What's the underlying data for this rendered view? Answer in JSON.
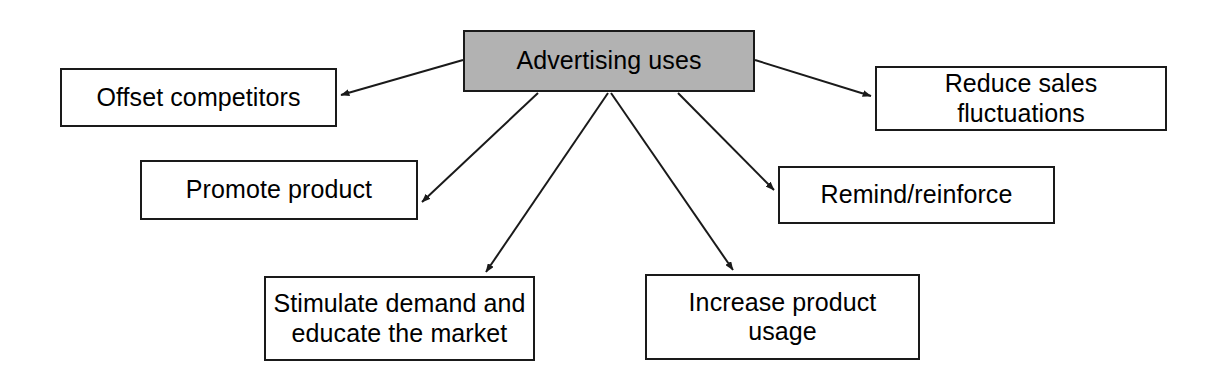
{
  "diagram": {
    "title": "Advertising uses",
    "type": "radial-concept-map",
    "background_color": "#ffffff",
    "root": {
      "id": "root",
      "label": "Advertising uses",
      "fill_color": "#b2b2b2",
      "border_color": "#1a1a1a",
      "x": 463,
      "y": 30,
      "width": 292,
      "height": 62
    },
    "nodes": [
      {
        "id": "offset-competitors",
        "label": "Offset competitors",
        "fill_color": "#ffffff",
        "border_color": "#1a1a1a",
        "x": 60,
        "y": 68,
        "width": 277,
        "height": 59
      },
      {
        "id": "reduce-sales-fluctuations",
        "label": "Reduce sales fluctuations",
        "fill_color": "#ffffff",
        "border_color": "#1a1a1a",
        "x": 875,
        "y": 66,
        "width": 292,
        "height": 65
      },
      {
        "id": "promote-product",
        "label": "Promote product",
        "fill_color": "#ffffff",
        "border_color": "#1a1a1a",
        "x": 140,
        "y": 160,
        "width": 278,
        "height": 60
      },
      {
        "id": "remind-reinforce",
        "label": "Remind/reinforce",
        "fill_color": "#ffffff",
        "border_color": "#1a1a1a",
        "x": 778,
        "y": 166,
        "width": 277,
        "height": 58
      },
      {
        "id": "stimulate-demand",
        "label": "Stimulate demand and\neducate the market",
        "fill_color": "#ffffff",
        "border_color": "#1a1a1a",
        "x": 264,
        "y": 276,
        "width": 271,
        "height": 85
      },
      {
        "id": "increase-product-usage",
        "label": "Increase product\nusage",
        "fill_color": "#ffffff",
        "border_color": "#1a1a1a",
        "x": 645,
        "y": 274,
        "width": 275,
        "height": 86
      }
    ],
    "edges": [
      {
        "id": "edge-offset-competitors",
        "from": "root",
        "to": "offset-competitors",
        "x1": 463,
        "y1": 60,
        "x2": 341,
        "y2": 95
      },
      {
        "id": "edge-reduce-sales-fluctuations",
        "from": "root",
        "to": "reduce-sales-fluctuations",
        "x1": 755,
        "y1": 60,
        "x2": 871,
        "y2": 96
      },
      {
        "id": "edge-promote-product",
        "from": "root",
        "to": "promote-product",
        "x1": 538,
        "y1": 93,
        "x2": 422,
        "y2": 202
      },
      {
        "id": "edge-remind-reinforce",
        "from": "root",
        "to": "remind-reinforce",
        "x1": 678,
        "y1": 93,
        "x2": 774,
        "y2": 190
      },
      {
        "id": "edge-stimulate-demand",
        "from": "root",
        "to": "stimulate-demand",
        "x1": 608,
        "y1": 93,
        "x2": 486,
        "y2": 272
      },
      {
        "id": "edge-increase-product-usage",
        "from": "root",
        "to": "increase-product-usage",
        "x1": 611,
        "y1": 93,
        "x2": 733,
        "y2": 270
      }
    ],
    "edge_color": "#1a1a1a"
  }
}
